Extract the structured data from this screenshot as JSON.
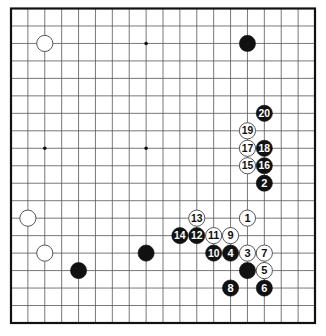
{
  "diagram": {
    "type": "go-board",
    "size": 19,
    "colors": {
      "background": "#ffffff",
      "grid": "#555555",
      "border": "#111111",
      "black_stone": "#111111",
      "white_stone": "#ffffff",
      "white_stone_edge": "#444444"
    },
    "star_points": [
      [
        3,
        3
      ],
      [
        9,
        3
      ],
      [
        15,
        3
      ],
      [
        3,
        9
      ],
      [
        9,
        9
      ],
      [
        15,
        9
      ],
      [
        3,
        15
      ],
      [
        9,
        15
      ],
      [
        15,
        15
      ]
    ],
    "stones": [
      {
        "color": "white",
        "col": 3,
        "row": 3,
        "label": ""
      },
      {
        "color": "black",
        "col": 15,
        "row": 3,
        "label": ""
      },
      {
        "color": "white",
        "col": 2,
        "row": 13,
        "label": ""
      },
      {
        "color": "white",
        "col": 3,
        "row": 15,
        "label": ""
      },
      {
        "color": "black",
        "col": 5,
        "row": 16,
        "label": ""
      },
      {
        "color": "black",
        "col": 9,
        "row": 15,
        "label": ""
      },
      {
        "color": "black",
        "col": 15,
        "row": 16,
        "label": ""
      },
      {
        "color": "white",
        "col": 15,
        "row": 13,
        "label": "1"
      },
      {
        "color": "black",
        "col": 16,
        "row": 11,
        "label": "2"
      },
      {
        "color": "white",
        "col": 15,
        "row": 15,
        "label": "3"
      },
      {
        "color": "black",
        "col": 14,
        "row": 15,
        "label": "4"
      },
      {
        "color": "white",
        "col": 16,
        "row": 16,
        "label": "5"
      },
      {
        "color": "black",
        "col": 16,
        "row": 17,
        "label": "6"
      },
      {
        "color": "white",
        "col": 16,
        "row": 15,
        "label": "7"
      },
      {
        "color": "black",
        "col": 14,
        "row": 17,
        "label": "8"
      },
      {
        "color": "white",
        "col": 14,
        "row": 14,
        "label": "9"
      },
      {
        "color": "black",
        "col": 13,
        "row": 15,
        "label": "10"
      },
      {
        "color": "white",
        "col": 13,
        "row": 14,
        "label": "11"
      },
      {
        "color": "black",
        "col": 12,
        "row": 14,
        "label": "12"
      },
      {
        "color": "white",
        "col": 12,
        "row": 13,
        "label": "13"
      },
      {
        "color": "black",
        "col": 11,
        "row": 14,
        "label": "14"
      },
      {
        "color": "white",
        "col": 15,
        "row": 10,
        "label": "15"
      },
      {
        "color": "black",
        "col": 16,
        "row": 10,
        "label": "16"
      },
      {
        "color": "white",
        "col": 15,
        "row": 9,
        "label": "17"
      },
      {
        "color": "black",
        "col": 16,
        "row": 9,
        "label": "18"
      },
      {
        "color": "white",
        "col": 15,
        "row": 8,
        "label": "19"
      },
      {
        "color": "black",
        "col": 16,
        "row": 7,
        "label": "20"
      }
    ]
  }
}
